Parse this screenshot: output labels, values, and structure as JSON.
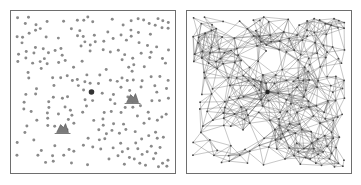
{
  "figure": {
    "panels": [
      {
        "id": "left",
        "label": "node-scatter",
        "caption": "",
        "node_color": "#8a8a8a",
        "hub_color": "#333333",
        "marker_color": "#7a7a7a",
        "border_color": "#6e6e6e"
      },
      {
        "id": "right",
        "label": "connectivity-graph",
        "caption": "",
        "edge_color": "#555555",
        "node_color": "#444444",
        "border_color": "#6e6e6e"
      }
    ],
    "landmarks": {
      "hub": {
        "x": 0.49,
        "y": 0.5
      },
      "markers": [
        {
          "x": 0.76,
          "y": 0.55
        },
        {
          "x": 0.3,
          "y": 0.75
        }
      ]
    },
    "node_count": 230,
    "seed": 7
  }
}
